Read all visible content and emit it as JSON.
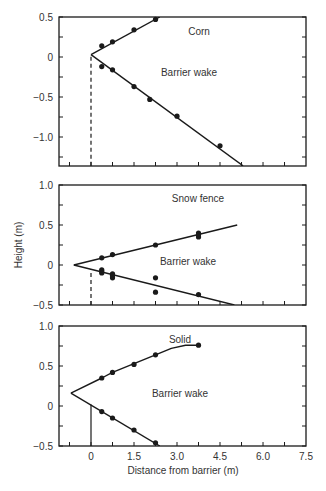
{
  "chart_data": {
    "type": "line",
    "title": "",
    "xlabel": "Distance from barrier (m)",
    "ylabel": "Height (m)",
    "xlim": [
      -1.12,
      7.5
    ],
    "x_ticks": [
      0,
      1.5,
      3.0,
      4.5,
      6.0,
      7.5
    ],
    "x_tick_labels": [
      "0",
      "1.5",
      "3.0",
      "4.5",
      "6.0",
      "7.5"
    ],
    "x_minor_step": 0.75,
    "panels": [
      {
        "title": "Corn",
        "annotation": "Barrier wake",
        "ylim": [
          -1.36,
          0.5
        ],
        "y_ticks": [
          0.5,
          0,
          -0.5,
          -1.0
        ],
        "y_tick_labels": [
          "0.5",
          "0",
          "−0.5",
          "−1.0"
        ],
        "barrier_line": {
          "x": 0,
          "style": "dashed",
          "y_from": -1.36,
          "y_to": 0.03
        },
        "apex": [
          0,
          0.03
        ],
        "upper_points": [
          [
            0.375,
            0.14
          ],
          [
            0.75,
            0.19
          ],
          [
            1.5,
            0.34
          ],
          [
            2.25,
            0.47
          ]
        ],
        "upper_line": [
          [
            0,
            0.03
          ],
          [
            2.4,
            0.5
          ]
        ],
        "lower_points": [
          [
            0.375,
            -0.12
          ],
          [
            0.75,
            -0.16
          ],
          [
            1.5,
            -0.37
          ],
          [
            2.05,
            -0.53
          ],
          [
            3.0,
            -0.74
          ],
          [
            4.5,
            -1.11
          ]
        ],
        "lower_line": [
          [
            0,
            0.03
          ],
          [
            5.3,
            -1.36
          ]
        ]
      },
      {
        "title": "Snow fence",
        "annotation": "Barrier wake",
        "ylim": [
          -0.5,
          1.0
        ],
        "y_ticks": [
          1.0,
          0.5,
          0,
          -0.5
        ],
        "y_tick_labels": [
          "1.0",
          "0.5",
          "0",
          "−0.5"
        ],
        "barrier_line": {
          "x": 0,
          "style": "dashed",
          "y_from": -0.5,
          "y_to": -0.05
        },
        "apex": [
          -0.6,
          0.0
        ],
        "upper_points": [
          [
            0.375,
            0.09
          ],
          [
            0.75,
            0.13
          ],
          [
            2.25,
            0.25
          ],
          [
            3.75,
            0.35
          ],
          [
            3.75,
            0.38
          ],
          [
            3.75,
            0.4
          ]
        ],
        "upper_line": [
          [
            -0.6,
            0.0
          ],
          [
            5.1,
            0.5
          ]
        ],
        "lower_points": [
          [
            0.375,
            -0.06
          ],
          [
            0.375,
            -0.08
          ],
          [
            0.375,
            -0.1
          ],
          [
            0.75,
            -0.11
          ],
          [
            0.75,
            -0.13
          ],
          [
            0.75,
            -0.16
          ],
          [
            2.25,
            -0.16
          ],
          [
            2.25,
            -0.34
          ],
          [
            3.75,
            -0.37
          ]
        ],
        "lower_line": [
          [
            -0.6,
            0.0
          ],
          [
            5.0,
            -0.5
          ]
        ]
      },
      {
        "title": "Solid",
        "annotation": "Barrier wake",
        "ylim": [
          -0.5,
          1.0
        ],
        "y_ticks": [
          1.0,
          0.5,
          0,
          -0.5
        ],
        "y_tick_labels": [
          "1.0",
          "0.5",
          "0",
          "−0.5"
        ],
        "barrier_line": {
          "x": 0,
          "style": "solid",
          "y_from": -0.5,
          "y_to": 0.02
        },
        "apex": [
          -0.7,
          0.16
        ],
        "upper_points": [
          [
            0.375,
            0.35
          ],
          [
            0.75,
            0.42
          ],
          [
            1.5,
            0.52
          ],
          [
            2.25,
            0.64
          ],
          [
            3.75,
            0.76
          ]
        ],
        "upper_line": [
          [
            -0.7,
            0.16
          ],
          [
            0.375,
            0.35
          ],
          [
            0.75,
            0.42
          ],
          [
            1.5,
            0.53
          ],
          [
            2.25,
            0.64
          ],
          [
            2.8,
            0.72
          ],
          [
            3.3,
            0.76
          ],
          [
            3.75,
            0.76
          ]
        ],
        "lower_points": [
          [
            0.375,
            -0.07
          ],
          [
            0.75,
            -0.15
          ],
          [
            1.5,
            -0.3
          ],
          [
            2.25,
            -0.46
          ]
        ],
        "lower_line": [
          [
            -0.7,
            0.16
          ],
          [
            2.4,
            -0.5
          ]
        ]
      }
    ]
  },
  "layout": {
    "x_px_per_m": 28.67,
    "x_zero_px": 91,
    "frame_left_px": 59,
    "frame_right_px": 306,
    "y_px_per_m": 80,
    "panels_px": [
      {
        "top": 17,
        "bottom": 166
      },
      {
        "top": 185,
        "bottom": 305
      },
      {
        "top": 326,
        "bottom": 446
      }
    ]
  },
  "labels": {
    "ylabel": "Height (m)",
    "xlabel": "Distance from barrier (m)"
  },
  "colors": {
    "line": "#1a1a1a",
    "text": "#333333",
    "background": "#ffffff"
  }
}
